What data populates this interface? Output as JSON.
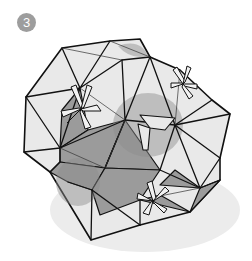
{
  "step": {
    "number": "3"
  },
  "figure": {
    "colors": {
      "face_light": "#e8e8e8",
      "face_dark": "#9a9a9a",
      "shadow_ground": "#ececec",
      "shadow_overlay": "#a6a6a6",
      "line": "#111111",
      "badge": "#9d9d9d"
    }
  }
}
